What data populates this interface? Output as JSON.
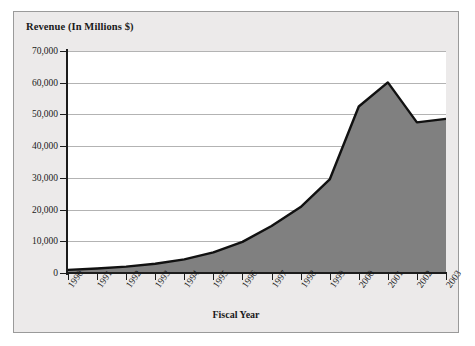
{
  "chart_data": {
    "type": "area",
    "title": "Revenue (In Millions $)",
    "xlabel": "Fiscal Year",
    "ylabel": "Revenue (In Millions $)",
    "categories": [
      "1990",
      "1991",
      "1992",
      "1993",
      "1994",
      "1995",
      "1996",
      "1997",
      "1998",
      "1999",
      "2000",
      "2001",
      "2002",
      "2003"
    ],
    "values": [
      1000,
      1400,
      2000,
      2900,
      4300,
      6500,
      9800,
      14800,
      20800,
      29500,
      52500,
      60100,
      47500,
      48600
    ],
    "ylim": [
      0,
      70000
    ],
    "ytick_labels": [
      "0",
      "10,000",
      "20,000",
      "30,000",
      "40,000",
      "50,000",
      "60,000",
      "70,000"
    ],
    "ytick_values": [
      0,
      10000,
      20000,
      30000,
      40000,
      50000,
      60000,
      70000
    ],
    "grid": "horizontal",
    "legend": "none",
    "series_fill_color": "#808080",
    "series_line_color": "#111111",
    "plot_background": "#ffffff",
    "figure_background": "#eceaea",
    "axis_color": "#1c1c1c",
    "gridline_color": "#b3b3b3"
  }
}
